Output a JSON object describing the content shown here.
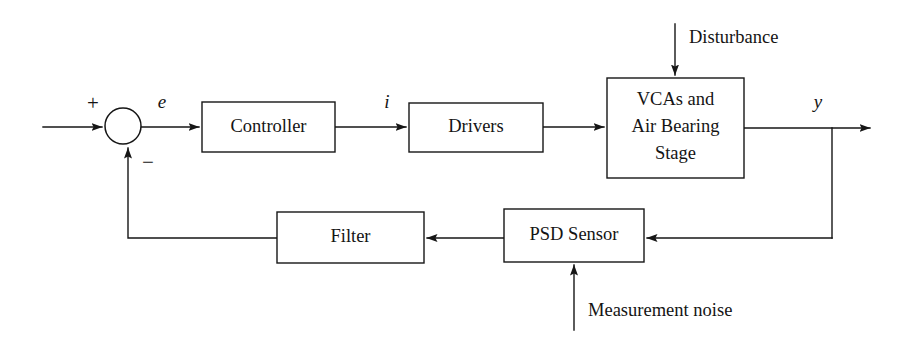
{
  "diagram": {
    "type": "control-system-block-diagram",
    "line_color": "#161616",
    "background_color": "#ffffff",
    "blocks": [
      {
        "id": "controller",
        "label": "Controller",
        "x": 202,
        "y": 102,
        "w": 133,
        "h": 50
      },
      {
        "id": "drivers",
        "label": "Drivers",
        "x": 409,
        "y": 103,
        "w": 134,
        "h": 49
      },
      {
        "id": "plant",
        "label_line1": "VCAs and",
        "label_line2": "Air Bearing",
        "label_line3": "Stage",
        "x": 607,
        "y": 78,
        "w": 137,
        "h": 100
      },
      {
        "id": "filter",
        "label": "Filter",
        "x": 277,
        "y": 212,
        "w": 147,
        "h": 51
      },
      {
        "id": "psd_sensor",
        "label": "PSD Sensor",
        "x": 504,
        "y": 209,
        "w": 140,
        "h": 53
      }
    ],
    "summing_junction": {
      "id": "sum",
      "cx": 123,
      "cy": 126,
      "r": 18,
      "plus_sign": "+",
      "minus_sign": "−"
    },
    "signal_labels": {
      "error": "e",
      "current": "i",
      "output": "y"
    },
    "external_inputs": {
      "disturbance": "Disturbance",
      "measurement_noise": "Measurement noise"
    }
  }
}
